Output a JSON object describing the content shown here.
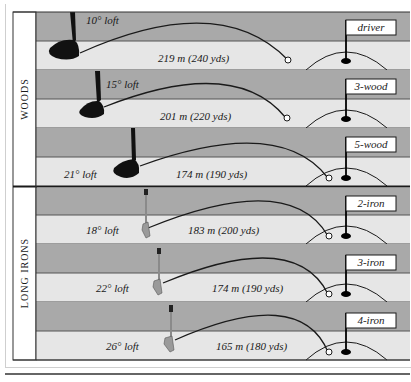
{
  "colors": {
    "sky": "#a9a9a9",
    "fairway": "#e6e6e6",
    "line": "#1a1a1a",
    "panel": "#ffffff"
  },
  "groups": [
    {
      "label": "WOODS"
    },
    {
      "label": "LONG IRONS"
    }
  ],
  "clubs": [
    {
      "name": "driver",
      "loft": "10° loft",
      "distance": "219 m (240 yds)",
      "type": "wood"
    },
    {
      "name": "3-wood",
      "loft": "15° loft",
      "distance": "201 m (220 yds)",
      "type": "wood"
    },
    {
      "name": "5-wood",
      "loft": "21° loft",
      "distance": "174 m (190 yds)",
      "type": "wood"
    },
    {
      "name": "2-iron",
      "loft": "18° loft",
      "distance": "183 m (200 yds)",
      "type": "iron"
    },
    {
      "name": "3-iron",
      "loft": "22° loft",
      "distance": "174 m (190 yds)",
      "type": "iron"
    },
    {
      "name": "4-iron",
      "loft": "26° loft",
      "distance": "165 m (180 yds)",
      "type": "iron"
    }
  ]
}
